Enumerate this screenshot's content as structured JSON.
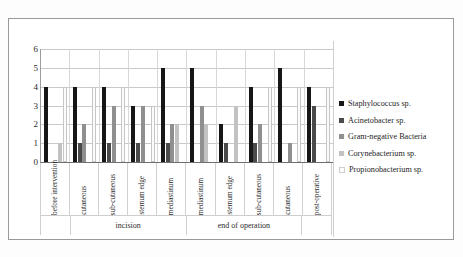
{
  "chart_data": {
    "type": "bar",
    "title": "",
    "xlabel": "",
    "ylabel": "",
    "ylim": [
      0,
      6
    ],
    "yticks": [
      "0",
      "1",
      "2",
      "3",
      "4",
      "5",
      "6"
    ],
    "grid": true,
    "legend_position": "right",
    "categories": [
      "before intervention",
      "cutaneous",
      "sub-cutaneous",
      "sternum edge",
      "mediastinum",
      "mediastinum",
      "sternum edge",
      "sub-cutaneous",
      "cutaneous",
      "post-operative"
    ],
    "group_labels": [
      {
        "label": "",
        "span": 1
      },
      {
        "label": "incision",
        "span": 4
      },
      {
        "label": "end of operation",
        "span": 4
      },
      {
        "label": "",
        "span": 1
      }
    ],
    "series": [
      {
        "name": "Staphylococcus sp.",
        "color": "#161616",
        "values": [
          4,
          4,
          4,
          3,
          5,
          5,
          2,
          4,
          5,
          4
        ]
      },
      {
        "name": "Acinetobacter sp.",
        "color": "#4a4a4a",
        "values": [
          0,
          1,
          1,
          1,
          1,
          0,
          1,
          1,
          0,
          3
        ]
      },
      {
        "name": "Gram-negative Bacteria",
        "color": "#8f8f8f",
        "values": [
          0,
          2,
          3,
          3,
          2,
          3,
          0,
          2,
          1,
          0
        ]
      },
      {
        "name": "Corynebacterium sp.",
        "color": "#c2c2c2",
        "values": [
          1,
          0,
          0,
          0,
          2,
          2,
          3,
          0,
          0,
          0
        ]
      },
      {
        "name": "Propionobacterium sp.",
        "color": "#fbfbfb",
        "values": [
          4,
          4,
          4,
          3,
          0,
          0,
          0,
          4,
          4,
          4
        ]
      }
    ]
  }
}
